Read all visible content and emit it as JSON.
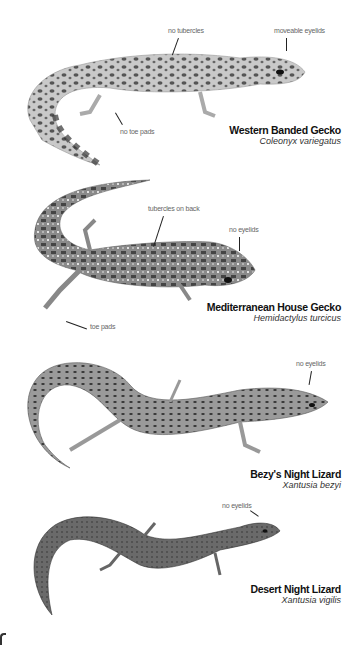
{
  "species": [
    {
      "common_name": "Western Banded Gecko",
      "scientific_name": "Coleonyx variegatus",
      "callouts": [
        "no tubercles",
        "moveable eyelids",
        "no toe pads"
      ]
    },
    {
      "common_name": "Mediterranean House Gecko",
      "scientific_name": "Hemidactylus turcicus",
      "callouts": [
        "tubercles on back",
        "no eyelids",
        "toe pads"
      ]
    },
    {
      "common_name": "Bezy's Night Lizard",
      "scientific_name": "Xantusia bezyi",
      "callouts": [
        "no eyelids"
      ]
    },
    {
      "common_name": "Desert Night Lizard",
      "scientific_name": "Xantusia vigilis",
      "callouts": [
        "no eyelids"
      ]
    }
  ],
  "colors": {
    "background": "#ffffff",
    "text": "#111111",
    "callout": "#666666"
  }
}
